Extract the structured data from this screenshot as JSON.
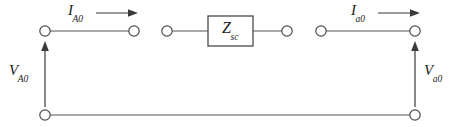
{
  "diagram": {
    "type": "electrical-circuit-schematic",
    "background_color": "#ffffff",
    "line_color": "#545454",
    "text_color": "#1a1a1a",
    "labels": {
      "current_left": {
        "base": "I",
        "sub": "A0",
        "text": "I_A0"
      },
      "current_right": {
        "base": "I",
        "sub": "a0",
        "text": "I_a0"
      },
      "voltage_left": {
        "base": "V",
        "sub": "A0",
        "text": "V_A0"
      },
      "voltage_right": {
        "base": "V",
        "sub": "a0",
        "text": "V_a0"
      },
      "impedance": {
        "base": "Z",
        "sub": "sc",
        "text": "Z_sc"
      }
    },
    "terminals": [
      {
        "name": "top-left-terminal",
        "x": 45,
        "y": 31
      },
      {
        "name": "top-left-inner-terminal",
        "x": 134,
        "y": 31
      },
      {
        "name": "box-left-terminal",
        "x": 167,
        "y": 31
      },
      {
        "name": "box-right-terminal",
        "x": 287,
        "y": 31
      },
      {
        "name": "top-right-inner-terminal",
        "x": 321,
        "y": 31
      },
      {
        "name": "top-right-terminal",
        "x": 415,
        "y": 31
      },
      {
        "name": "bottom-left-terminal",
        "x": 45,
        "y": 115
      },
      {
        "name": "bottom-right-terminal",
        "x": 415,
        "y": 115
      }
    ],
    "impedance_box": {
      "x": 208,
      "y": 16,
      "width": 45,
      "height": 30
    }
  }
}
